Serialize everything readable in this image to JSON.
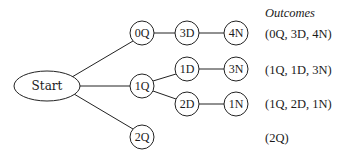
{
  "diagram": {
    "type": "tree",
    "colors": {
      "stroke": "#222222",
      "text": "#1a1a1a",
      "background": "#ffffff"
    },
    "nodes": {
      "start": {
        "label": "Start"
      },
      "q0": {
        "label": "0Q"
      },
      "q1": {
        "label": "1Q"
      },
      "q2": {
        "label": "2Q"
      },
      "d3": {
        "label": "3D"
      },
      "n4": {
        "label": "4N"
      },
      "d1": {
        "label": "1D"
      },
      "n3": {
        "label": "3N"
      },
      "d2": {
        "label": "2D"
      },
      "n1": {
        "label": "1N"
      }
    },
    "edges": [
      [
        "start",
        "q0"
      ],
      [
        "start",
        "q1"
      ],
      [
        "start",
        "q2"
      ],
      [
        "q0",
        "d3"
      ],
      [
        "d3",
        "n4"
      ],
      [
        "q1",
        "d1"
      ],
      [
        "d1",
        "n3"
      ],
      [
        "q1",
        "d2"
      ],
      [
        "d2",
        "n1"
      ]
    ],
    "outcomes": {
      "header": "Outcomes",
      "items": [
        "(0Q, 3D, 4N)",
        "(1Q, 1D, 3N)",
        "(1Q, 2D, 1N)",
        "(2Q)"
      ]
    }
  }
}
